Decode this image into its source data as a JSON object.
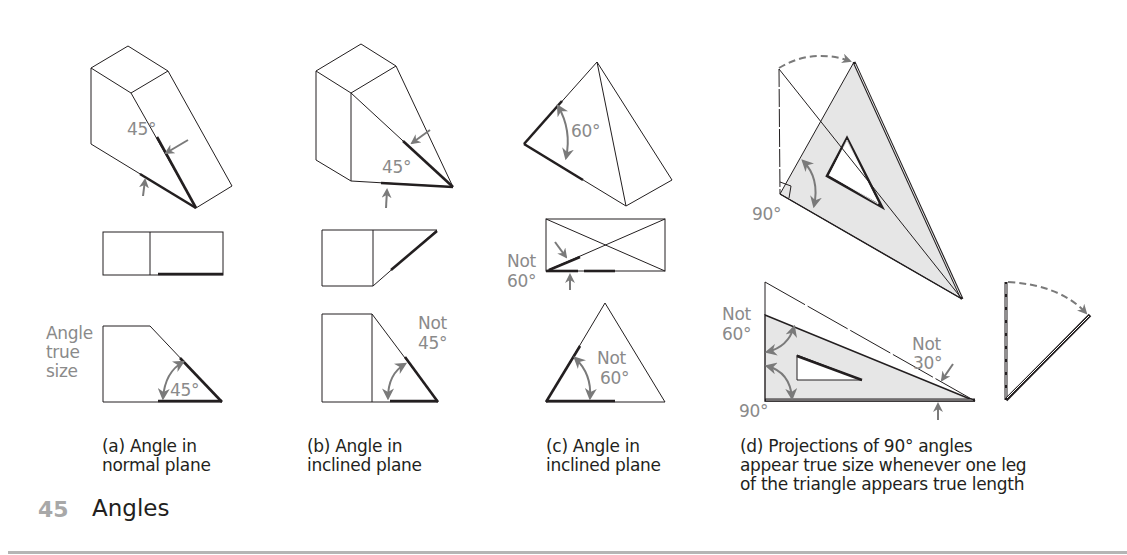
{
  "figure": {
    "number": "45",
    "title": "Angles",
    "panels": [
      {
        "id": "a",
        "caption_line1": "(a) Angle in",
        "caption_line2": "normal plane",
        "labels": {
          "iso_angle": "45°",
          "side_note_line1": "Angle",
          "side_note_line2": "true",
          "side_note_line3": "size",
          "front_angle": "45°"
        }
      },
      {
        "id": "b",
        "caption_line1": "(b) Angle in",
        "caption_line2": "inclined plane",
        "labels": {
          "iso_angle": "45°",
          "front_note_line1": "Not",
          "front_note_line2": "45°"
        }
      },
      {
        "id": "c",
        "caption_line1": "(c) Angle in",
        "caption_line2": "inclined plane",
        "labels": {
          "iso_angle": "60°",
          "top_note_line1": "Not",
          "top_note_line2": "60°",
          "front_note_line1": "Not",
          "front_note_line2": "60°"
        }
      },
      {
        "id": "d",
        "caption_line1": "(d) Projections of 90° angles",
        "caption_line2": "appear true size whenever one leg",
        "caption_line3": "of the triangle appears true length",
        "labels": {
          "upper_right_angle": "90°",
          "lower_note60_line1": "Not",
          "lower_note60_line2": "60°",
          "lower_note30_line1": "Not",
          "lower_note30_line2": "30°",
          "lower_right_angle": "90°"
        }
      }
    ],
    "colors": {
      "line": "#231f20",
      "arrow": "#7a7a7a",
      "label": "#8a8a8a",
      "shade": "#e6e6e6",
      "figure_number": "#a8a8a8",
      "rule": "#b5b5b5"
    }
  }
}
